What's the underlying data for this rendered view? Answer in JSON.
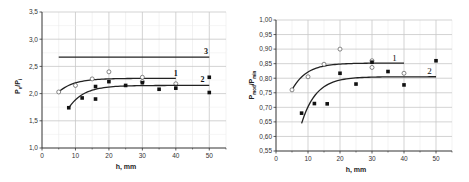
{
  "chart_data": [
    {
      "type": "scatter",
      "title": "",
      "xlabel": "h, mm",
      "ylabel": "Pe/Pi",
      "xlim": [
        0,
        55
      ],
      "ylim": [
        1.0,
        3.5
      ],
      "x_ticks": [
        "0",
        "10",
        "20",
        "30",
        "40",
        "50"
      ],
      "y_ticks": [
        "1,0",
        "1,5",
        "2,0",
        "2,5",
        "3,0",
        "3,5"
      ],
      "grid": true,
      "series": [
        {
          "name": "1",
          "marker": "open-circle",
          "points": [
            [
              5,
              2.03
            ],
            [
              10,
              2.15
            ],
            [
              15,
              2.27
            ],
            [
              20,
              2.4
            ],
            [
              30,
              2.3
            ],
            [
              30,
              2.22
            ],
            [
              40,
              2.18
            ]
          ],
          "fit": {
            "type": "saturating",
            "x_start": 5,
            "x_end": 40,
            "y_start": 2.03,
            "y_asymptote": 2.28
          }
        },
        {
          "name": "2",
          "marker": "filled-square",
          "points": [
            [
              8,
              1.74
            ],
            [
              12,
              1.92
            ],
            [
              16,
              2.13
            ],
            [
              16,
              1.9
            ],
            [
              20,
              2.22
            ],
            [
              25,
              2.15
            ],
            [
              30,
              2.2
            ],
            [
              35,
              2.08
            ],
            [
              40,
              2.1
            ],
            [
              50,
              2.3
            ],
            [
              50,
              2.02
            ]
          ],
          "fit": {
            "type": "saturating",
            "x_start": 8,
            "x_end": 50,
            "y_start": 1.74,
            "y_asymptote": 2.15
          }
        },
        {
          "name": "3",
          "marker": "none",
          "line": {
            "type": "horizontal",
            "x_start": 5,
            "x_end": 50,
            "y": 2.67
          }
        }
      ],
      "curve_labels": [
        {
          "text": "1",
          "x": 40,
          "y": 2.33
        },
        {
          "text": "2",
          "x": 48,
          "y": 2.21
        },
        {
          "text": "3",
          "x": 49,
          "y": 2.72
        }
      ]
    },
    {
      "type": "scatter",
      "title": "",
      "xlabel": "h, mm",
      "ylabel": "Pmod/Pmin",
      "xlim": [
        0,
        55
      ],
      "ylim": [
        0.55,
        1.0
      ],
      "x_ticks": [
        "0",
        "10",
        "20",
        "30",
        "40",
        "50"
      ],
      "y_ticks": [
        "0,55",
        "0,60",
        "0,65",
        "0,70",
        "0,75",
        "0,80",
        "0,85",
        "0,90",
        "0,95",
        "1,00"
      ],
      "grid": true,
      "series": [
        {
          "name": "1",
          "marker": "open-circle",
          "points": [
            [
              5,
              0.76
            ],
            [
              10,
              0.805
            ],
            [
              15,
              0.848
            ],
            [
              20,
              0.9
            ],
            [
              30,
              0.86
            ],
            [
              30,
              0.837
            ],
            [
              40,
              0.817
            ]
          ],
          "fit": {
            "type": "saturating",
            "x_start": 5,
            "x_end": 40,
            "y_start": 0.76,
            "y_asymptote": 0.852
          }
        },
        {
          "name": "2",
          "marker": "filled-square",
          "points": [
            [
              8,
              0.68
            ],
            [
              12,
              0.713
            ],
            [
              16,
              0.712
            ],
            [
              20,
              0.817
            ],
            [
              25,
              0.78
            ],
            [
              30,
              0.855
            ],
            [
              35,
              0.823
            ],
            [
              40,
              0.777
            ],
            [
              50,
              0.86
            ]
          ],
          "fit": {
            "type": "saturating",
            "x_start": 8,
            "x_end": 50,
            "y_start": 0.645,
            "y_asymptote": 0.805
          }
        }
      ],
      "curve_labels": [
        {
          "text": "1",
          "x": 37,
          "y": 0.86
        },
        {
          "text": "2",
          "x": 48,
          "y": 0.815
        }
      ]
    }
  ],
  "left": {
    "ylabel_main": "P",
    "ylabel_sub1": "e",
    "ylabel_sep": "/P",
    "ylabel_sub2": "i",
    "xlabel": "h, mm"
  },
  "right": {
    "ylabel_main": "P",
    "ylabel_sub1": "mod",
    "ylabel_sep": "/P",
    "ylabel_sub2": "min",
    "xlabel": "h, mm"
  }
}
